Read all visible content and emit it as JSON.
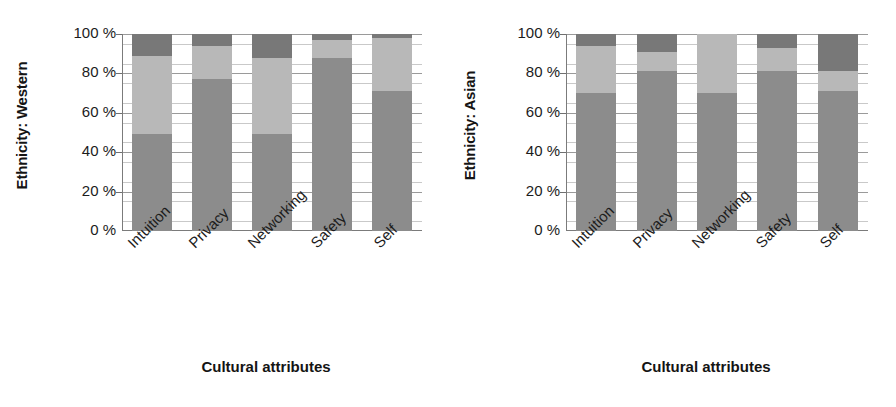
{
  "chart_data": [
    {
      "type": "bar",
      "subtype": "stacked-bar-100pct",
      "title": "",
      "panel_label": "Ethnicity: Western",
      "ylabel": "Ethnicity: Western",
      "xlabel": "Cultural attributes",
      "categories": [
        "Intuition",
        "Privacy",
        "Networking",
        "Safety",
        "Self"
      ],
      "ytick_labels": [
        "100 %",
        "80 %",
        "60 %",
        "40 %",
        "20 %",
        "0 %"
      ],
      "ytick_values": [
        100,
        80,
        60,
        40,
        20,
        0
      ],
      "ylim": [
        0,
        100
      ],
      "grid": true,
      "minor_gridlines": true,
      "legend": "none",
      "series": [
        {
          "name": "bottom",
          "color": "#8c8c8c",
          "values": [
            49,
            77,
            49,
            88,
            71
          ]
        },
        {
          "name": "middle",
          "color": "#b8b8b8",
          "values": [
            40,
            17,
            39,
            9,
            27
          ]
        },
        {
          "name": "top",
          "color": "#787878",
          "values": [
            11,
            6,
            12,
            3,
            2
          ]
        }
      ]
    },
    {
      "type": "bar",
      "subtype": "stacked-bar-100pct",
      "title": "",
      "panel_label": "Ethnicity: Asian",
      "ylabel": "Ethnicity: Asian",
      "xlabel": "Cultural attributes",
      "categories": [
        "Intuition",
        "Privacy",
        "Networking",
        "Safety",
        "Self"
      ],
      "ytick_labels": [
        "100 %",
        "80 %",
        "60 %",
        "40 %",
        "20 %",
        "0 %"
      ],
      "ytick_values": [
        100,
        80,
        60,
        40,
        20,
        0
      ],
      "ylim": [
        0,
        100
      ],
      "grid": true,
      "minor_gridlines": true,
      "legend": "none",
      "series": [
        {
          "name": "bottom",
          "color": "#8c8c8c",
          "values": [
            70,
            81,
            70,
            81,
            71
          ]
        },
        {
          "name": "middle",
          "color": "#b8b8b8",
          "values": [
            24,
            10,
            30,
            12,
            10
          ]
        },
        {
          "name": "top",
          "color": "#787878",
          "values": [
            6,
            9,
            0,
            7,
            19
          ]
        }
      ]
    }
  ],
  "panels": [
    {
      "id": "western",
      "y_axis_title": "Ethnicity: Western",
      "x_axis_title": "Cultural attributes",
      "y_ticks": [
        "100 %",
        "80 %",
        "60 %",
        "40 %",
        "20 %",
        "0 %"
      ],
      "x_categories": [
        "Intuition",
        "Privacy",
        "Networking",
        "Safety",
        "Self"
      ]
    },
    {
      "id": "asian",
      "y_axis_title": "Ethnicity: Asian",
      "x_axis_title": "Cultural attributes",
      "y_ticks": [
        "100 %",
        "80 %",
        "60 %",
        "40 %",
        "20 %",
        "0 %"
      ],
      "x_categories": [
        "Intuition",
        "Privacy",
        "Networking",
        "Safety",
        "Self"
      ]
    }
  ],
  "colors": {
    "segment_bottom": "#8c8c8c",
    "segment_middle": "#b8b8b8",
    "segment_top": "#787878",
    "axis": "#7b7b7b",
    "gridline_major": "#9a9a9a",
    "gridline_minor": "#c9c9c9",
    "text": "#1c1c1c",
    "background": "#ffffff"
  }
}
